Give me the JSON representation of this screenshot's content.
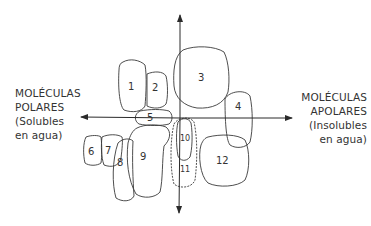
{
  "left_label": {
    "line1": "MOLÉCULAS",
    "line2": "POLARES",
    "line3": "(Solubles",
    "line4": "en agua)"
  },
  "right_label": {
    "line1": "MOLÉCULAS",
    "line2": "APOLARES",
    "line3": "(Insolubles",
    "line4": "en agua)"
  },
  "axes": {
    "horizontal": {
      "from_x": 80,
      "to_x": 292,
      "y": 118,
      "arrows": "both"
    },
    "vertical": {
      "x": 180,
      "from_y": 15,
      "to_y": 213,
      "arrows": "both"
    }
  },
  "regions": [
    {
      "id": "1",
      "label": "1"
    },
    {
      "id": "2",
      "label": "2"
    },
    {
      "id": "3",
      "label": "3"
    },
    {
      "id": "4",
      "label": "4"
    },
    {
      "id": "5",
      "label": "5"
    },
    {
      "id": "6",
      "label": "6"
    },
    {
      "id": "7",
      "label": "7"
    },
    {
      "id": "8",
      "label": "8"
    },
    {
      "id": "9",
      "label": "9"
    },
    {
      "id": "10",
      "label": "10"
    },
    {
      "id": "11",
      "label": "11"
    },
    {
      "id": "12",
      "label": "12"
    }
  ],
  "colors": {
    "stroke": "#3a3a3a",
    "text": "#333333",
    "background": "#ffffff"
  }
}
